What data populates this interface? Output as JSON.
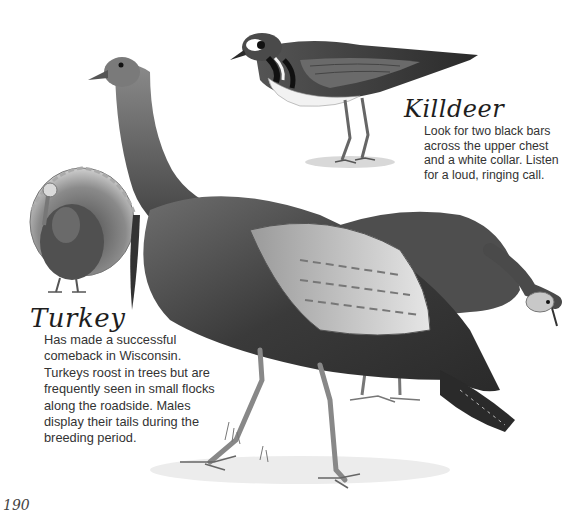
{
  "page": {
    "page_number": "190",
    "background": "#ffffff"
  },
  "species": [
    {
      "name": "Killdeer",
      "lines": [
        "Look for two black bars",
        "across the upper chest",
        "and a white collar. Listen",
        "for a loud, ringing call."
      ],
      "illustration": "killdeer-pencil-drawing"
    },
    {
      "name": "Turkey",
      "lines": [
        "Has made a successful",
        "comeback in Wisconsin.",
        "Turkeys roost in trees but are",
        "frequently seen in small flocks",
        "along the roadside. Males",
        "display their tails during the",
        "breeding period."
      ],
      "illustration": "wild-turkey-pencil-drawing"
    }
  ],
  "colors": {
    "ink_dark": "#1e1e1e",
    "ink_mid": "#5a5a5a",
    "ink_light": "#a8a8a8",
    "paper": "#ffffff"
  }
}
